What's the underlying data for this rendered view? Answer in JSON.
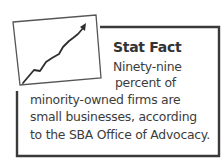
{
  "callout": {
    "title": "Stat Fact",
    "body_lines": [
      "Ninety-nine",
      "percent of",
      "minority-owned firms are",
      "small businesses, according",
      "to the SBA Office of Advocacy."
    ]
  },
  "icon": {
    "name": "rising-line-chart-icon",
    "colors": {
      "stroke": "#2e2e2e",
      "frame": "#3a3a3a",
      "background": "#ffffff"
    }
  }
}
